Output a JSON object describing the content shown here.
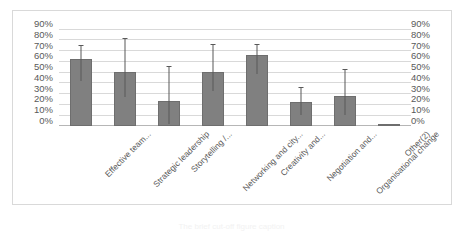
{
  "chart_data": {
    "type": "bar",
    "title": "",
    "xlabel": "",
    "ylabel": "",
    "ylim": [
      0,
      90
    ],
    "grid": true,
    "legend": false,
    "dual_y_axis": true,
    "categories": [
      "Effective team...",
      "Strategic leadership",
      "Storytelling /...",
      "Networking and city...",
      "Creativity and...",
      "Negotiation and...",
      "Organisational change",
      "Other(2)"
    ],
    "values": [
      62,
      50,
      23,
      50,
      65,
      22,
      27,
      1
    ],
    "error_high": [
      75,
      81,
      55,
      76,
      76,
      36,
      52,
      1
    ],
    "error_low": [
      41,
      26,
      1,
      32,
      48,
      10,
      10,
      1
    ],
    "tick_labels_left": [
      "90%",
      "80%",
      "70%",
      "60%",
      "50%",
      "40%",
      "30%",
      "20%",
      "10%",
      "0%"
    ],
    "tick_labels_right": [
      "90%",
      "80%",
      "70%",
      "60%",
      "50%",
      "40%",
      "30%",
      "20%",
      "10%",
      "0%"
    ],
    "tick_values": [
      90,
      80,
      70,
      60,
      50,
      40,
      30,
      20,
      10,
      0
    ],
    "series_color": "#808080",
    "grid_color": "#d9d9d9",
    "text_color": "#5a5a5a"
  },
  "caption": {
    "text": "The brief cut-off figure caption"
  }
}
